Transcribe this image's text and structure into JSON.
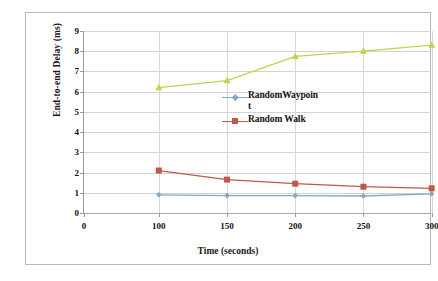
{
  "chart_data": {
    "type": "line",
    "title": "",
    "xlabel": "Time (seconds)",
    "ylabel": "End-to-end Delay (ms)",
    "x": [
      100,
      150,
      200,
      250,
      300
    ],
    "x_tick_labels": [
      "0",
      "100",
      "150",
      "200",
      "250",
      "300"
    ],
    "y_tick_labels": [
      "0",
      "1",
      "2",
      "3",
      "4",
      "5",
      "6",
      "7",
      "8",
      "9"
    ],
    "xlim": [
      0,
      300
    ],
    "ylim": [
      0,
      9
    ],
    "grid": true,
    "legend_position": "center-right",
    "series": [
      {
        "name": "RandomWaypoint",
        "legend_label_line1": "RandomWaypoin",
        "legend_label_line2": "t",
        "color": "#7FA8CC",
        "marker": "diamond",
        "values": [
          0.9,
          0.86,
          0.86,
          0.84,
          0.95
        ]
      },
      {
        "name": "Random Walk",
        "legend_label_line1": "Random Walk",
        "legend_label_line2": "",
        "color": "#C0594A",
        "marker": "square",
        "values": [
          2.1,
          1.65,
          1.45,
          1.3,
          1.22
        ]
      },
      {
        "name": "Green series",
        "legend_label_line1": "",
        "legend_label_line2": "",
        "color": "#C4D14B",
        "marker": "triangle",
        "values": [
          6.2,
          6.55,
          7.75,
          8.0,
          8.3
        ]
      }
    ]
  }
}
